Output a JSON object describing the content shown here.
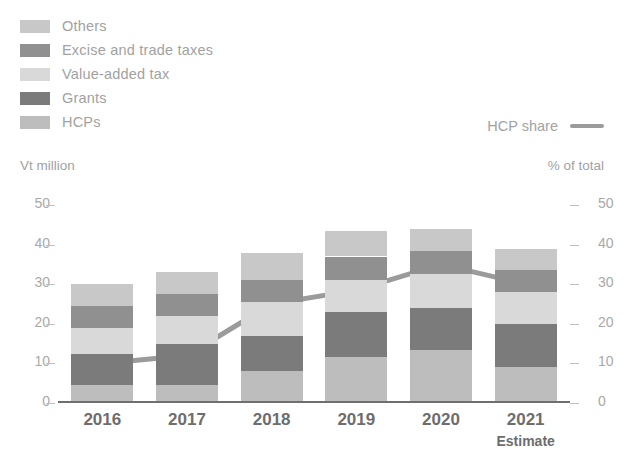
{
  "legend": {
    "items": [
      {
        "label": "Others",
        "color": "#c8c8c8"
      },
      {
        "label": "Excise and trade taxes",
        "color": "#909090"
      },
      {
        "label": "Value-added tax",
        "color": "#d9d9d9"
      },
      {
        "label": "Grants",
        "color": "#7b7b7b"
      },
      {
        "label": "HCPs",
        "color": "#bdbdbd"
      }
    ],
    "line_series_label": "HCP share",
    "line_color": "#9b9b9b"
  },
  "axes": {
    "left_caption": "Vt million",
    "right_caption": "% of total",
    "left_ticks": [
      "50",
      "40",
      "30",
      "20",
      "10",
      "0"
    ],
    "right_ticks": [
      "50",
      "40",
      "30",
      "20",
      "10",
      "0"
    ],
    "tick_dash": "_"
  },
  "chart_data": {
    "type": "bar",
    "title": "",
    "subtitle": "",
    "xlabel": "",
    "ylabel": "Vt million",
    "y2label": "% of total",
    "ylim": [
      0,
      50
    ],
    "y2lim": [
      0,
      50
    ],
    "grid": false,
    "legend_position": "top-left",
    "stacked": true,
    "categories": [
      "2016",
      "2017",
      "2018",
      "2019",
      "2020",
      "2021"
    ],
    "category_sublabels": [
      "",
      "",
      "",
      "",
      "",
      "Estimate"
    ],
    "series": [
      {
        "name": "HCPs",
        "color": "#bdbdbd",
        "values": [
          4.5,
          4.5,
          8.0,
          11.5,
          13.5,
          9.0
        ]
      },
      {
        "name": "Grants",
        "color": "#7b7b7b",
        "values": [
          8.0,
          10.5,
          9.0,
          11.5,
          10.5,
          11.0
        ]
      },
      {
        "name": "Value-added tax",
        "color": "#d9d9d9",
        "values": [
          6.5,
          7.0,
          8.5,
          8.0,
          8.5,
          8.0
        ]
      },
      {
        "name": "Excise and trade taxes",
        "color": "#909090",
        "values": [
          5.5,
          5.5,
          5.5,
          6.0,
          6.0,
          5.5
        ]
      },
      {
        "name": "Others",
        "color": "#c8c8c8",
        "values": [
          5.5,
          5.5,
          7.0,
          6.5,
          5.5,
          5.5
        ]
      }
    ],
    "totals": [
      30.0,
      33.0,
      38.0,
      43.5,
      39.0,
      39.0
    ],
    "line_series": {
      "name": "HCP share",
      "color": "#9b9b9b",
      "axis": "right",
      "values": [
        10.0,
        12.0,
        25.0,
        28.5,
        35.0,
        30.0
      ]
    }
  }
}
